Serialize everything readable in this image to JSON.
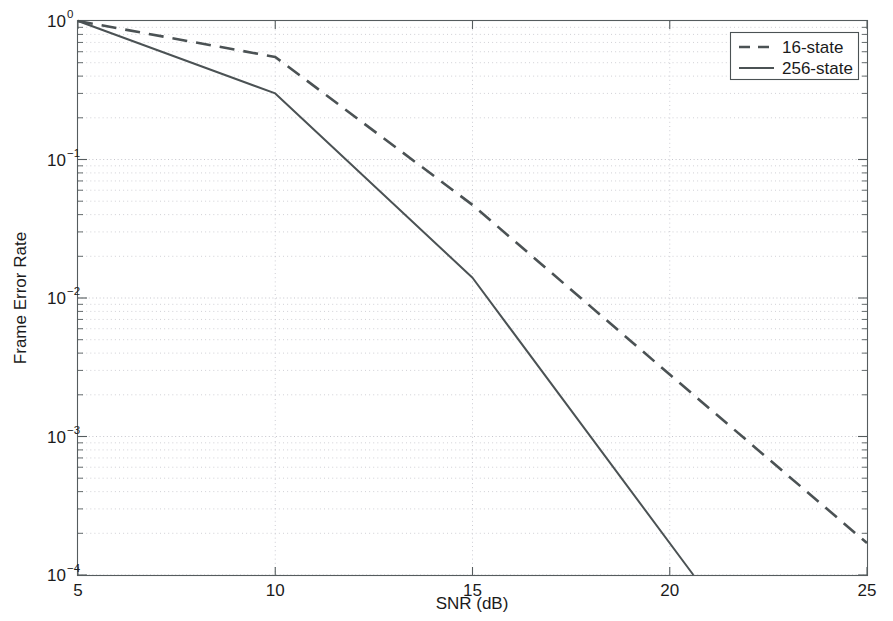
{
  "figure": {
    "background": "#ffffff",
    "line_color": "#4b5254",
    "grid_color": "#c9c9cf",
    "axis_color": "#555c5e"
  },
  "chart_data": {
    "type": "line",
    "title": "",
    "xlabel": "SNR (dB)",
    "ylabel": "Frame Error Rate",
    "xlim": [
      5,
      25
    ],
    "ylim": [
      0.0001,
      1
    ],
    "yscale": "log",
    "xscale": "linear",
    "grid": true,
    "legend_position": "upper right",
    "xticks": [
      5,
      10,
      15,
      20,
      25
    ],
    "xticklabels": [
      "5",
      "10",
      "15",
      "20",
      "25"
    ],
    "yticks": [
      1,
      0.1,
      0.01,
      0.001,
      0.0001
    ],
    "yticklabels": [
      "10^0",
      "10^-1",
      "10^-2",
      "10^-3",
      "10^-4"
    ],
    "ytick_mantissa": [
      "10",
      "10",
      "10",
      "10",
      "10"
    ],
    "ytick_exponent": [
      "0",
      "-1",
      "-2",
      "-3",
      "-4"
    ],
    "series": [
      {
        "name": "16-state",
        "style": "dashed",
        "x": [
          5,
          10,
          15,
          20,
          25
        ],
        "y": [
          1.0,
          0.55,
          0.047,
          0.0028,
          0.00017
        ]
      },
      {
        "name": "256-state",
        "style": "solid",
        "x": [
          5,
          10,
          15,
          20.6
        ],
        "y": [
          1.0,
          0.3,
          0.014,
          0.0001
        ]
      }
    ]
  },
  "legend": {
    "entries": [
      {
        "label": "16-state",
        "style": "dashed"
      },
      {
        "label": "256-state",
        "style": "solid"
      }
    ]
  },
  "caption": {
    "text": ""
  }
}
